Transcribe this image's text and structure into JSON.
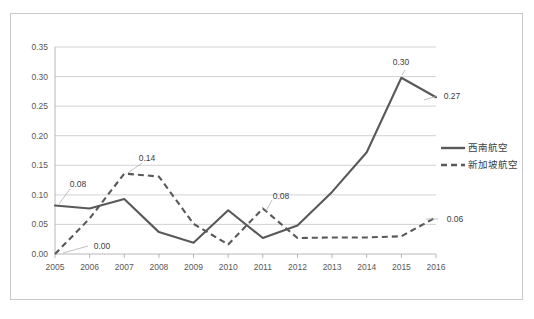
{
  "chart_data": {
    "type": "line",
    "title": "",
    "xlabel": "",
    "ylabel": "",
    "categories": [
      "2005",
      "2006",
      "2007",
      "2008",
      "2009",
      "2010",
      "2011",
      "2012",
      "2013",
      "2014",
      "2015",
      "2016"
    ],
    "ylim": [
      0.0,
      0.35
    ],
    "ytick_labels": [
      "0.00",
      "0.05",
      "0.10",
      "0.15",
      "0.20",
      "0.25",
      "0.30",
      "0.35"
    ],
    "ytick_values": [
      0.0,
      0.05,
      0.1,
      0.15,
      0.2,
      0.25,
      0.3,
      0.35
    ],
    "grid": true,
    "legend_position": "right",
    "series": [
      {
        "name": "西南航空",
        "style": "solid",
        "color": "#595959",
        "values": [
          0.082,
          0.077,
          0.093,
          0.037,
          0.019,
          0.074,
          0.027,
          0.048,
          0.105,
          0.172,
          0.298,
          0.265
        ]
      },
      {
        "name": "新加坡航空",
        "style": "dashed",
        "color": "#595959",
        "values": [
          0.0,
          0.06,
          0.136,
          0.131,
          0.051,
          0.016,
          0.077,
          0.027,
          0.028,
          0.028,
          0.03,
          0.062
        ]
      }
    ],
    "annotations": [
      {
        "label": "0.08",
        "series": "西南航空",
        "category": "2005",
        "value": 0.082
      },
      {
        "label": "0.00",
        "series": "新加坡航空",
        "category": "2005",
        "value": 0.0
      },
      {
        "label": "0.14",
        "series": "新加坡航空",
        "category": "2007",
        "value": 0.136
      },
      {
        "label": "0.08",
        "series": "新加坡航空",
        "category": "2011",
        "value": 0.077
      },
      {
        "label": "0.30",
        "series": "西南航空",
        "category": "2015",
        "value": 0.298
      },
      {
        "label": "0.27",
        "series": "西南航空",
        "category": "2016",
        "value": 0.265
      },
      {
        "label": "0.06",
        "series": "新加坡航空",
        "category": "2016",
        "value": 0.062
      }
    ]
  },
  "legend": {
    "items": [
      {
        "label": "西南航空",
        "style": "solid"
      },
      {
        "label": "新加坡航空",
        "style": "dashed"
      }
    ]
  }
}
